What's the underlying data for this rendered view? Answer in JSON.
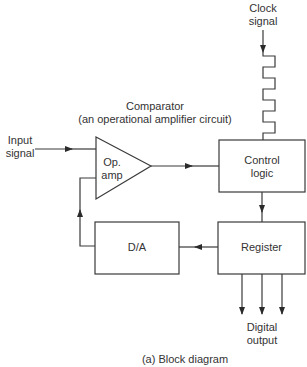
{
  "diagram": {
    "caption": "(a) Block diagram",
    "comparator_title": "Comparator",
    "comparator_subtitle": "(an operational amplifier circuit)",
    "input": {
      "line1": "Input",
      "line2": "signal"
    },
    "clock": {
      "line1": "Clock",
      "line2": "signal"
    },
    "opamp": {
      "line1": "Op.",
      "line2": "amp"
    },
    "control": {
      "line1": "Control",
      "line2": "logic"
    },
    "register": {
      "label": "Register"
    },
    "da": {
      "label": "D/A"
    },
    "output": {
      "line1": "Digital",
      "line2": "output"
    },
    "line_color": "#3a3a3a"
  }
}
